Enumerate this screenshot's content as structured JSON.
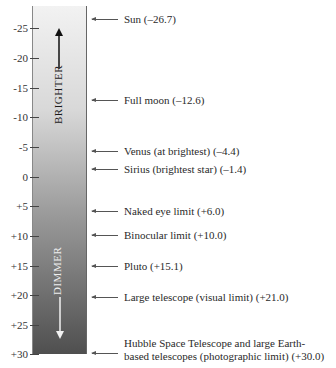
{
  "diagram": {
    "axis": {
      "ticks": [
        "-25",
        "-20",
        "-15",
        "-10",
        "-5",
        "0",
        "+5",
        "+10",
        "+15",
        "+20",
        "+25",
        "+30"
      ],
      "tick_values": [
        -25,
        -20,
        -15,
        -10,
        -5,
        0,
        5,
        10,
        15,
        20,
        25,
        30
      ],
      "range": [
        -28,
        30
      ]
    },
    "direction_labels": {
      "top": "BRIGHTER",
      "bottom": "DIMMER"
    },
    "annotations": [
      {
        "label": "Sun (–26.7)",
        "value": -26.7
      },
      {
        "label": "Full moon (–12.6)",
        "value": -12.6
      },
      {
        "label": "Venus (at brightest) (–4.4)",
        "value": -4.4
      },
      {
        "label": "Sirius (brightest star) (–1.4)",
        "value": -1.4
      },
      {
        "label": "Naked eye limit (+6.0)",
        "value": 6.0
      },
      {
        "label": "Binocular limit (+10.0)",
        "value": 10.0
      },
      {
        "label": "Pluto (+15.1)",
        "value": 15.1
      },
      {
        "label": "Large telescope (visual limit) (+21.0)",
        "value": 21.0
      },
      {
        "label_line1": "Hubble Space Telescope and large Earth-",
        "label_line2": "based telescopes (photographic limit) (+30.0)",
        "value": 30.0
      }
    ]
  }
}
